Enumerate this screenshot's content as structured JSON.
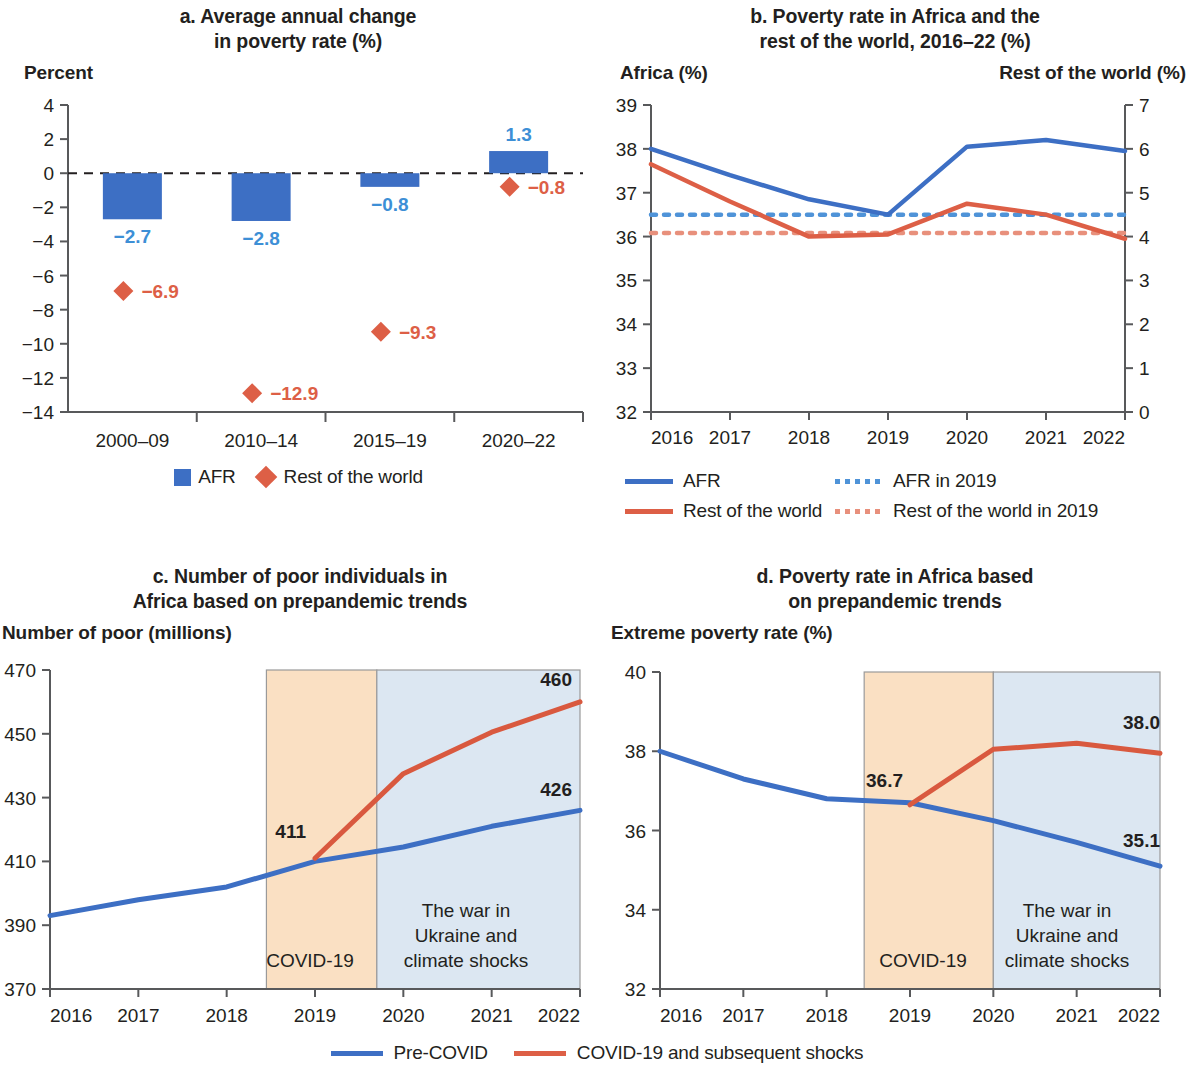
{
  "colors": {
    "blue": "#3d6fc4",
    "red": "#dd5f46",
    "blue_label": "#3d8fd6",
    "axis": "#58595b",
    "text": "#231f20",
    "covid_band": "#fae0c3",
    "war_band": "#dce7f2",
    "band_border": "#9a9a9a"
  },
  "panel_a": {
    "title_line1": "a. Average annual change",
    "title_line2": "in poverty rate (%)",
    "y_axis_label": "Percent",
    "legend": [
      {
        "marker": "square",
        "label": "AFR",
        "color": "#3d6fc4"
      },
      {
        "marker": "diamond",
        "label": "Rest of the world",
        "color": "#dd5f46"
      }
    ],
    "chart_data": {
      "type": "bar",
      "title": "a. Average annual change in poverty rate (%)",
      "xlabel": "",
      "ylabel": "Percent",
      "ylim": [
        -14,
        4
      ],
      "yticks": [
        4,
        2,
        0,
        -2,
        -4,
        -6,
        -8,
        -10,
        -12,
        -14
      ],
      "ytick_labels": [
        "4",
        "2",
        "0",
        "-2",
        "-4",
        "-6",
        "-8",
        "-10",
        "-12",
        "-14"
      ],
      "categories": [
        "2000–09",
        "2010–14",
        "2015–19",
        "2020–22"
      ],
      "series": [
        {
          "name": "AFR",
          "type": "bar",
          "color": "#3d6fc4",
          "values": [
            -2.7,
            -2.8,
            -0.8,
            1.3
          ],
          "labels": [
            "-2.7",
            "-2.8",
            "-0.8",
            "1.3"
          ]
        },
        {
          "name": "Rest of the world",
          "type": "scatter",
          "color": "#dd5f46",
          "values": [
            -6.9,
            -12.9,
            -9.3,
            -0.8
          ],
          "labels": [
            "-6.9",
            "-12.9",
            "-9.3",
            "-0.8"
          ]
        }
      ],
      "zero_line": true,
      "grid": false,
      "legend_position": "bottom"
    }
  },
  "panel_b": {
    "title_line1": "b. Poverty rate in Africa and the",
    "title_line2": "rest of the world, 2016–22 (%)",
    "left_axis_label": "Africa (%)",
    "right_axis_label": "Rest of the world (%)",
    "legend": [
      {
        "style": "solid",
        "label": "AFR",
        "color": "#3d6fc4"
      },
      {
        "style": "dotted",
        "label": "AFR in 2019",
        "color": "#3d8fd6"
      },
      {
        "style": "solid",
        "label": "Rest of the world",
        "color": "#dd5f46"
      },
      {
        "style": "dotted",
        "label": "Rest of the world in 2019",
        "color": "#e8907c"
      }
    ],
    "chart_data": {
      "type": "line",
      "title": "b. Poverty rate in Africa and the rest of the world, 2016–22 (%)",
      "xlabel": "",
      "ylabel": "Africa (%)",
      "y2label": "Rest of the world (%)",
      "ylim": [
        32,
        39
      ],
      "y2lim": [
        0,
        7
      ],
      "yticks": [
        32,
        33,
        34,
        35,
        36,
        37,
        38,
        39
      ],
      "y2ticks": [
        0,
        1,
        2,
        3,
        4,
        5,
        6,
        7
      ],
      "x": [
        "2016",
        "2017",
        "2018",
        "2019",
        "2020",
        "2021",
        "2022"
      ],
      "series": [
        {
          "name": "AFR",
          "axis": "left",
          "color": "#3d6fc4",
          "style": "solid",
          "values": [
            38.0,
            37.4,
            36.85,
            36.5,
            38.05,
            38.2,
            37.95
          ]
        },
        {
          "name": "Rest of the world",
          "axis": "right",
          "color": "#dd5f46",
          "style": "solid",
          "values": [
            5.65,
            4.8,
            4.0,
            4.05,
            4.75,
            4.5,
            3.95
          ]
        },
        {
          "name": "AFR in 2019",
          "axis": "left",
          "color": "#3d8fd6",
          "style": "dotted",
          "constant": 36.5
        },
        {
          "name": "Rest of the world in 2019",
          "axis": "right",
          "color": "#e8907c",
          "style": "dotted",
          "constant": 4.08
        }
      ],
      "grid": false,
      "legend_position": "bottom"
    }
  },
  "panel_c": {
    "title_line1": "c. Number of poor individuals in",
    "title_line2": "Africa based on prepandemic trends",
    "y_axis_label": "Number of poor (millions)",
    "band_covid_label": "COVID-19",
    "band_war_label_lines": [
      "The war in",
      "Ukraine and",
      "climate shocks"
    ],
    "chart_data": {
      "type": "line",
      "title": "c. Number of poor individuals in Africa based on prepandemic trends",
      "xlabel": "",
      "ylabel": "Number of poor (millions)",
      "ylim": [
        370,
        470
      ],
      "yticks": [
        370,
        390,
        410,
        430,
        450,
        470
      ],
      "x": [
        "2016",
        "2017",
        "2018",
        "2019",
        "2020",
        "2021",
        "2022"
      ],
      "series": [
        {
          "name": "Pre-COVID",
          "color": "#3d6fc4",
          "values": [
            393.0,
            398.0,
            402.0,
            410.0,
            414.5,
            421.0,
            426.0
          ],
          "end_label": "426"
        },
        {
          "name": "COVID-19 and subsequent shocks",
          "color": "#dd5f46",
          "values": [
            null,
            null,
            null,
            411.0,
            437.5,
            450.5,
            460.0
          ],
          "point_label": "411",
          "end_label": "460"
        }
      ],
      "bands": [
        {
          "label": "COVID-19",
          "x_start": 2018.45,
          "x_end": 2019.7,
          "color": "#fae0c3"
        },
        {
          "label": "The war in Ukraine and climate shocks",
          "x_start": 2019.7,
          "x_end": 2022.0,
          "color": "#dce7f2"
        }
      ],
      "grid": false
    }
  },
  "panel_d": {
    "title_line1": "d. Poverty rate in Africa based",
    "title_line2": "on prepandemic trends",
    "y_axis_label": "Extreme poverty rate (%)",
    "band_covid_label": "COVID-19",
    "band_war_label_lines": [
      "The war in",
      "Ukraine and",
      "climate shocks"
    ],
    "chart_data": {
      "type": "line",
      "title": "d. Poverty rate in Africa based on prepandemic trends",
      "xlabel": "",
      "ylabel": "Extreme poverty rate (%)",
      "ylim": [
        32,
        40
      ],
      "yticks": [
        32,
        34,
        36,
        38,
        40
      ],
      "x": [
        "2016",
        "2017",
        "2018",
        "2019",
        "2020",
        "2021",
        "2022"
      ],
      "series": [
        {
          "name": "Pre-COVID",
          "color": "#3d6fc4",
          "values": [
            38.0,
            37.3,
            36.8,
            36.7,
            36.25,
            35.7,
            35.1
          ],
          "end_label": "35.1"
        },
        {
          "name": "COVID-19 and subsequent shocks",
          "color": "#dd5f46",
          "values": [
            null,
            null,
            null,
            36.65,
            38.05,
            38.2,
            37.95
          ],
          "point_label": "36.7",
          "end_label": "38.0"
        }
      ],
      "bands": [
        {
          "label": "COVID-19",
          "x_start": 2018.45,
          "x_end": 2020.0,
          "color": "#fae0c3"
        },
        {
          "label": "The war in Ukraine and climate shocks",
          "x_start": 2020.0,
          "x_end": 2022.0,
          "color": "#dce7f2"
        }
      ],
      "grid": false
    }
  },
  "bottom_legend": [
    {
      "label": "Pre-COVID",
      "color": "#3d6fc4"
    },
    {
      "label": "COVID-19 and subsequent shocks",
      "color": "#dd5f46"
    }
  ]
}
